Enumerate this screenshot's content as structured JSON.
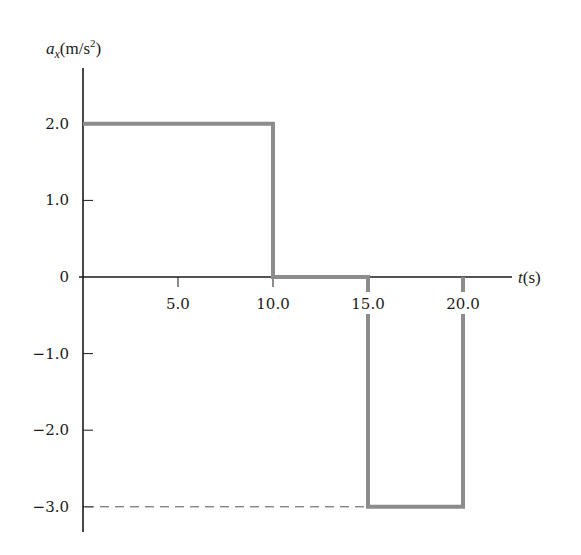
{
  "chart_data": {
    "type": "line",
    "title": "",
    "xlabel": "t(s)",
    "ylabel": "a_x(m/s^2)",
    "ylabel_parts": {
      "symbol": "a",
      "subscript": "x",
      "unit_open": "(m/s",
      "superscript": "2",
      "unit_close": ")"
    },
    "xlabel_parts": {
      "symbol": "t",
      "unit": "(s)"
    },
    "xlim": [
      0,
      22.5
    ],
    "ylim": [
      -3.3,
      2.7
    ],
    "grid": false,
    "legend": null,
    "x_ticks": [
      5.0,
      10.0,
      15.0,
      20.0
    ],
    "x_tick_labels": [
      "5.0",
      "10.0",
      "15.0",
      "20.0"
    ],
    "y_ticks": [
      2.0,
      1.0,
      0,
      -1.0,
      -2.0,
      -3.0
    ],
    "y_tick_labels": [
      "2.0",
      "1.0",
      "0",
      "-1.0",
      "-2.0",
      "-3.0"
    ],
    "series": [
      {
        "name": "a_x(t)",
        "style": "step",
        "color": "#8c8c8c",
        "x": [
          0,
          10,
          10,
          15,
          15,
          20,
          20
        ],
        "y": [
          2.0,
          2.0,
          0,
          0,
          -3.0,
          -3.0,
          0
        ]
      }
    ],
    "annotations": [
      {
        "type": "dashed-hline",
        "y": -3.0,
        "x_from": 0,
        "x_to": 15,
        "color": "#555555"
      }
    ]
  },
  "colors": {
    "axis": "#1a1a1a",
    "series": "#8c8c8c",
    "dashed": "#555555",
    "background": "#ffffff"
  }
}
